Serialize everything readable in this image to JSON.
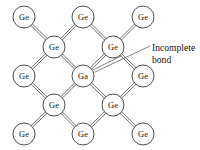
{
  "figure": {
    "name": "germanium-lattice-with-gallium-dopant",
    "background_color": "#ffffff",
    "ink_color": "#1a1a1a",
    "bond_color": "#4a4a4a",
    "atom_radius": 11,
    "bond_gap": 2.1,
    "atoms": [
      {
        "id": "a-r1c1",
        "symbol": "Ge",
        "x": 24,
        "y": 17,
        "row": 1,
        "col": 1,
        "type": "host"
      },
      {
        "id": "a-r1c2",
        "symbol": "Ge",
        "x": 83,
        "y": 17,
        "row": 1,
        "col": 2,
        "type": "host"
      },
      {
        "id": "a-r1c3",
        "symbol": "Ge",
        "x": 143,
        "y": 17,
        "row": 1,
        "col": 3,
        "type": "host"
      },
      {
        "id": "a-r2c1",
        "symbol": "Ge",
        "x": 54,
        "y": 47,
        "row": 2,
        "col": 1,
        "type": "host"
      },
      {
        "id": "a-r2c2",
        "symbol": "Ge",
        "x": 113,
        "y": 47,
        "row": 2,
        "col": 2,
        "type": "host"
      },
      {
        "id": "a-r3c1",
        "symbol": "Ge",
        "x": 24,
        "y": 76,
        "row": 3,
        "col": 1,
        "type": "host"
      },
      {
        "id": "a-r3c2",
        "symbol": "Ga",
        "x": 83,
        "y": 76,
        "row": 3,
        "col": 2,
        "type": "dopant"
      },
      {
        "id": "a-r3c3",
        "symbol": "Ge",
        "x": 143,
        "y": 76,
        "row": 3,
        "col": 3,
        "type": "host"
      },
      {
        "id": "a-r4c1",
        "symbol": "Ge",
        "x": 54,
        "y": 105,
        "row": 4,
        "col": 1,
        "type": "host"
      },
      {
        "id": "a-r4c2",
        "symbol": "Ge",
        "x": 113,
        "y": 105,
        "row": 4,
        "col": 2,
        "type": "host"
      },
      {
        "id": "a-r5c1",
        "symbol": "Ge",
        "x": 24,
        "y": 134,
        "row": 5,
        "col": 1,
        "type": "host"
      },
      {
        "id": "a-r5c2",
        "symbol": "Ge",
        "x": 83,
        "y": 134,
        "row": 5,
        "col": 2,
        "type": "host"
      },
      {
        "id": "a-r5c3",
        "symbol": "Ge",
        "x": 143,
        "y": 134,
        "row": 5,
        "col": 3,
        "type": "host"
      }
    ],
    "bonds": [
      {
        "id": "b-01",
        "from": "a-r1c1",
        "to": "a-r2c1",
        "style": "double"
      },
      {
        "id": "b-02",
        "from": "a-r1c2",
        "to": "a-r2c1",
        "style": "double"
      },
      {
        "id": "b-03",
        "from": "a-r1c2",
        "to": "a-r2c2",
        "style": "double"
      },
      {
        "id": "b-04",
        "from": "a-r1c3",
        "to": "a-r2c2",
        "style": "double"
      },
      {
        "id": "b-05",
        "from": "a-r2c1",
        "to": "a-r3c1",
        "style": "double"
      },
      {
        "id": "b-06",
        "from": "a-r2c1",
        "to": "a-r3c2",
        "style": "double"
      },
      {
        "id": "b-07",
        "from": "a-r2c2",
        "to": "a-r3c2",
        "style": "double"
      },
      {
        "id": "b-08",
        "from": "a-r2c2",
        "to": "a-r3c3",
        "style": "double"
      },
      {
        "id": "b-09",
        "from": "a-r3c1",
        "to": "a-r4c1",
        "style": "double"
      },
      {
        "id": "b-10",
        "from": "a-r3c2",
        "to": "a-r4c1",
        "style": "double"
      },
      {
        "id": "b-11",
        "from": "a-r3c2",
        "to": "a-r4c2",
        "style": "double"
      },
      {
        "id": "b-12",
        "from": "a-r3c3",
        "to": "a-r4c2",
        "style": "double"
      },
      {
        "id": "b-13",
        "from": "a-r4c1",
        "to": "a-r5c1",
        "style": "double"
      },
      {
        "id": "b-14",
        "from": "a-r4c1",
        "to": "a-r5c2",
        "style": "double"
      },
      {
        "id": "b-15",
        "from": "a-r4c2",
        "to": "a-r5c2",
        "style": "double"
      },
      {
        "id": "b-16",
        "from": "a-r4c2",
        "to": "a-r5c3",
        "style": "double"
      }
    ],
    "incomplete_bond": {
      "id": "incomplete-bond",
      "from": "a-r3c2",
      "to": "a-r2c2",
      "style": "single",
      "x1": 93,
      "y1": 70,
      "x2": 121,
      "y2": 56
    },
    "callout": {
      "id": "incomplete-bond-callout",
      "line1": "Incomplete",
      "line2": "bond",
      "text_x": 152,
      "line1_y": 51,
      "line2_y": 63,
      "leader": {
        "x1": 95,
        "y1": 72,
        "x2": 150,
        "y2": 46
      }
    }
  }
}
